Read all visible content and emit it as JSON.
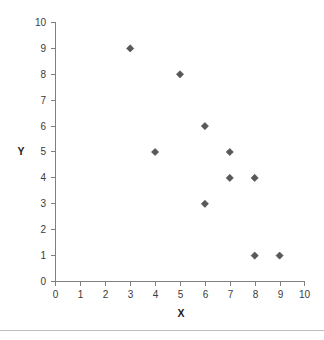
{
  "chart_data": {
    "type": "scatter",
    "title": "",
    "xlabel": "X",
    "ylabel": "Y",
    "xlim": [
      0,
      10
    ],
    "ylim": [
      0,
      10
    ],
    "xticks": [
      0,
      1,
      2,
      3,
      4,
      5,
      6,
      7,
      8,
      9,
      10
    ],
    "yticks": [
      0,
      1,
      2,
      3,
      4,
      5,
      6,
      7,
      8,
      9,
      10
    ],
    "xtick_labels": [
      "0",
      "1",
      "2",
      "3",
      "4",
      "5",
      "6",
      "7",
      "8",
      "9",
      "10"
    ],
    "ytick_labels": [
      "0",
      "1",
      "2",
      "3",
      "4",
      "5",
      "6",
      "7",
      "8",
      "9",
      "10"
    ],
    "grid": false,
    "legend": false,
    "marker": "diamond",
    "marker_color": "#595959",
    "axis_color": "#808080",
    "points": [
      {
        "x": 3,
        "y": 9
      },
      {
        "x": 5,
        "y": 8
      },
      {
        "x": 6,
        "y": 6
      },
      {
        "x": 4,
        "y": 5
      },
      {
        "x": 7,
        "y": 5
      },
      {
        "x": 7,
        "y": 4
      },
      {
        "x": 8,
        "y": 4
      },
      {
        "x": 6,
        "y": 3
      },
      {
        "x": 8,
        "y": 1
      },
      {
        "x": 9,
        "y": 1
      }
    ],
    "x": [
      3,
      5,
      6,
      4,
      7,
      7,
      8,
      6,
      8,
      9
    ],
    "y": [
      9,
      8,
      6,
      5,
      5,
      4,
      4,
      3,
      1,
      1
    ]
  }
}
